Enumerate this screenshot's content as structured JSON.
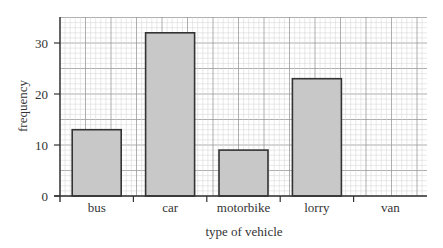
{
  "chart_data": {
    "type": "bar",
    "title": "",
    "xlabel": "type of vehicle",
    "ylabel": "frequency",
    "categories": [
      "bus",
      "car",
      "motorbike",
      "lorry",
      "van"
    ],
    "values": [
      13,
      32,
      9,
      23,
      0
    ],
    "ylim": [
      0,
      35
    ],
    "yticks": [
      0,
      10,
      20,
      30
    ],
    "grid": true,
    "legend": null,
    "bar_color": "#c8c8c8",
    "bar_edge_color": "#333333"
  }
}
